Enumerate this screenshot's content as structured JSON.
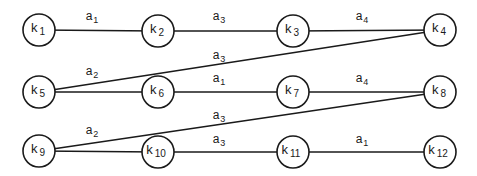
{
  "diagram": {
    "type": "state-transition-graph",
    "node_radius": 16,
    "colors": {
      "stroke": "#1a1a1a",
      "background": "#ffffff"
    },
    "nodes": [
      {
        "id": "k1",
        "base": "k",
        "sub": "1",
        "x": 39,
        "y": 30
      },
      {
        "id": "k2",
        "base": "k",
        "sub": "2",
        "x": 158,
        "y": 31
      },
      {
        "id": "k3",
        "base": "k",
        "sub": "3",
        "x": 293,
        "y": 31
      },
      {
        "id": "k4",
        "base": "k",
        "sub": "4",
        "x": 440,
        "y": 30
      },
      {
        "id": "k5",
        "base": "k",
        "sub": "5",
        "x": 39,
        "y": 92
      },
      {
        "id": "k6",
        "base": "k",
        "sub": "6",
        "x": 158,
        "y": 92
      },
      {
        "id": "k7",
        "base": "k",
        "sub": "7",
        "x": 293,
        "y": 92
      },
      {
        "id": "k8",
        "base": "k",
        "sub": "8",
        "x": 440,
        "y": 92
      },
      {
        "id": "k9",
        "base": "k",
        "sub": "9",
        "x": 39,
        "y": 151
      },
      {
        "id": "k10",
        "base": "k",
        "sub": "10",
        "x": 158,
        "y": 152
      },
      {
        "id": "k11",
        "base": "k",
        "sub": "11",
        "x": 293,
        "y": 152
      },
      {
        "id": "k12",
        "base": "k",
        "sub": "12",
        "x": 440,
        "y": 152
      }
    ],
    "edges": [
      {
        "from": "k1",
        "to": "k2",
        "base": "a",
        "sub": "1",
        "lx": 92,
        "ly": 20
      },
      {
        "from": "k2",
        "to": "k3",
        "base": "a",
        "sub": "3",
        "lx": 219,
        "ly": 20
      },
      {
        "from": "k3",
        "to": "k4",
        "base": "a",
        "sub": "4",
        "lx": 362,
        "ly": 20
      },
      {
        "from": "k5",
        "to": "k4",
        "base": "a",
        "sub": "3",
        "lx": 219,
        "ly": 59
      },
      {
        "from": "k5",
        "to": "k6",
        "base": "a",
        "sub": "2",
        "lx": 92,
        "ly": 75
      },
      {
        "from": "k6",
        "to": "k7",
        "base": "a",
        "sub": "1",
        "lx": 219,
        "ly": 82
      },
      {
        "from": "k7",
        "to": "k8",
        "base": "a",
        "sub": "4",
        "lx": 362,
        "ly": 82
      },
      {
        "from": "k9",
        "to": "k8",
        "base": "a",
        "sub": "3",
        "lx": 219,
        "ly": 119
      },
      {
        "from": "k9",
        "to": "k10",
        "base": "a",
        "sub": "2",
        "lx": 92,
        "ly": 134
      },
      {
        "from": "k10",
        "to": "k11",
        "base": "a",
        "sub": "3",
        "lx": 219,
        "ly": 143
      },
      {
        "from": "k11",
        "to": "k12",
        "base": "a",
        "sub": "1",
        "lx": 362,
        "ly": 143
      }
    ]
  }
}
